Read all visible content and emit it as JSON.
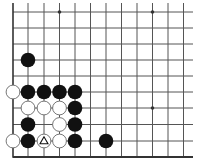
{
  "diagram": {
    "type": "go-board-partial",
    "view": "bottom-left corner",
    "columns": 12,
    "rows": 10,
    "grid": {
      "x": [
        13,
        28,
        44,
        59.5,
        75,
        90.5,
        106,
        121.5,
        137,
        152.5,
        168,
        183.5
      ],
      "y": [
        12,
        28,
        44,
        60,
        76,
        92,
        108,
        124.5,
        141,
        157
      ],
      "line_extend_right_to": 193,
      "line_extend_top_to": 3,
      "edges": {
        "left": true,
        "bottom": true,
        "top": false,
        "right": false
      }
    },
    "colors": {
      "background": "#ffffff",
      "line": "#555555",
      "edge": "#333333",
      "black_stone": "#111111",
      "white_stone": "#ffffff",
      "white_stone_border": "#666666",
      "marker": "#111111"
    },
    "stone_radius": 7.3,
    "star_points": [
      {
        "col": 3,
        "row": 0
      },
      {
        "col": 9,
        "row": 0
      },
      {
        "col": 9,
        "row": 6
      }
    ],
    "stones": [
      {
        "color": "black",
        "col": 1,
        "row": 3
      },
      {
        "color": "white",
        "col": 0,
        "row": 5
      },
      {
        "color": "black",
        "col": 1,
        "row": 5
      },
      {
        "color": "black",
        "col": 2,
        "row": 5
      },
      {
        "color": "black",
        "col": 3,
        "row": 5
      },
      {
        "color": "black",
        "col": 4,
        "row": 5
      },
      {
        "color": "white",
        "col": 1,
        "row": 6
      },
      {
        "color": "white",
        "col": 2,
        "row": 6
      },
      {
        "color": "white",
        "col": 3,
        "row": 6
      },
      {
        "color": "black",
        "col": 4,
        "row": 6
      },
      {
        "color": "black",
        "col": 1,
        "row": 7
      },
      {
        "color": "white",
        "col": 3,
        "row": 7
      },
      {
        "color": "black",
        "col": 4,
        "row": 7
      },
      {
        "color": "white",
        "col": 0,
        "row": 8
      },
      {
        "color": "black",
        "col": 1,
        "row": 8
      },
      {
        "color": "white",
        "col": 2,
        "row": 8,
        "marker": "triangle"
      },
      {
        "color": "white",
        "col": 3,
        "row": 8
      },
      {
        "color": "black",
        "col": 4,
        "row": 8
      },
      {
        "color": "black",
        "col": 6,
        "row": 8
      }
    ]
  }
}
